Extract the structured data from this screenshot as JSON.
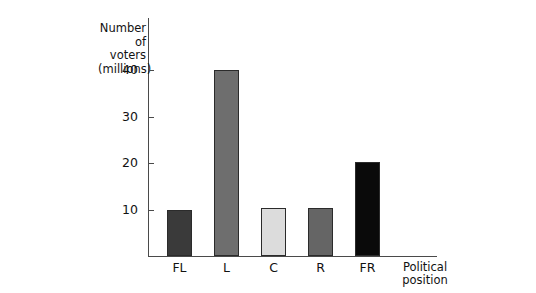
{
  "chart_data": {
    "type": "bar",
    "title": "",
    "xlabel": "Political position",
    "ylabel": "Number of voters (millions)",
    "ylabel_lines": [
      "Number",
      "of voters",
      "(millions)"
    ],
    "xlabel_lines": [
      "Political",
      "position"
    ],
    "categories": [
      "FL",
      "L",
      "C",
      "R",
      "FR"
    ],
    "values": [
      10.0,
      40.0,
      10.3,
      10.3,
      20.3
    ],
    "bar_colors": [
      "#3a3a3a",
      "#6e6e6e",
      "#dcdcdc",
      "#656565",
      "#0a0a0a"
    ],
    "ylim": [
      0,
      44
    ],
    "yticks": [
      10,
      20,
      30,
      40
    ],
    "ytick_labels": [
      "10",
      "20",
      "30",
      "40"
    ],
    "grid": false,
    "legend": false
  }
}
